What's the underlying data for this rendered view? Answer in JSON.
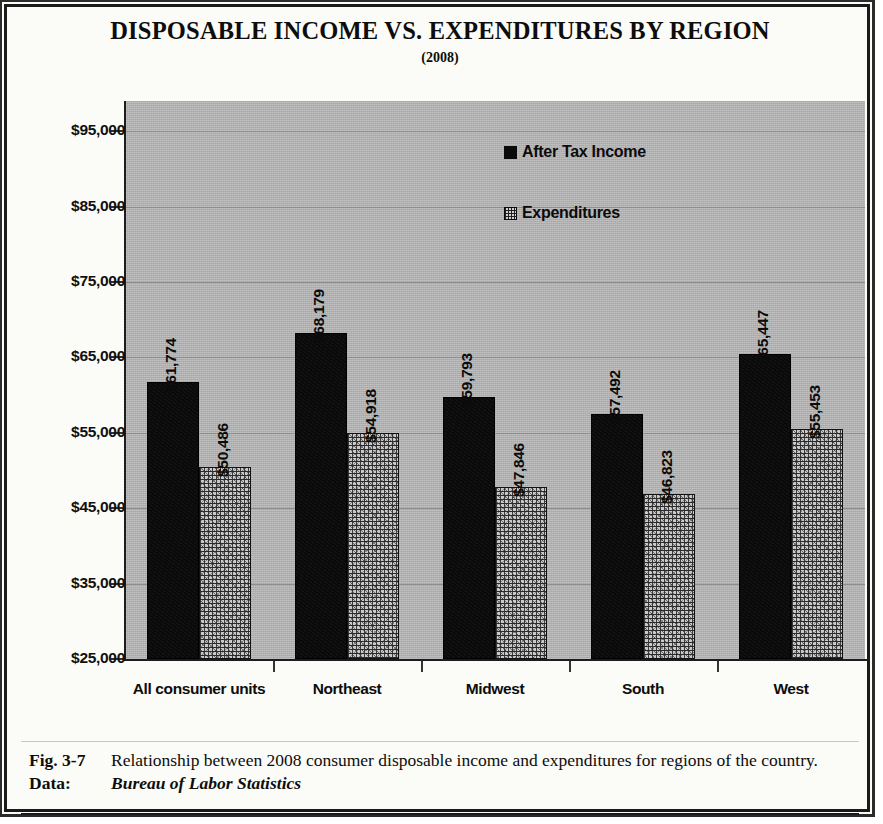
{
  "figure": {
    "title": "DISPOSABLE INCOME VS. EXPENDITURES BY REGION",
    "subtitle": "(2008)",
    "caption_number": "Fig. 3-7",
    "caption_text": "Relationship between 2008 consumer disposable income and expenditures for regions of the country.",
    "data_label": "Data:",
    "data_source": "Bureau of Labor Statistics"
  },
  "legend": {
    "position": "inside-top-center",
    "entries": [
      {
        "label": "After Tax Income",
        "swatch": "solid-black-square"
      },
      {
        "label": "Expenditures",
        "swatch": "crosshatch-square"
      }
    ]
  },
  "colors": {
    "plot_background": "#b0b0b0",
    "income_bar": "#0a0a0a",
    "expenditure_bar": "#c9c9c9",
    "gridline": "#8e8e8e",
    "axis": "#1c1c1c",
    "frame": "#1a1a1a",
    "page_background": "#fbfbf7"
  },
  "chart_data": {
    "type": "bar",
    "title": "DISPOSABLE INCOME VS. EXPENDITURES BY REGION",
    "subtitle": "(2008)",
    "xlabel": "",
    "ylabel": "",
    "ylim": [
      25000,
      99000
    ],
    "ytick_values": [
      25000,
      35000,
      45000,
      55000,
      65000,
      75000,
      85000,
      95000
    ],
    "ytick_labels": [
      "$25,000",
      "$35,000",
      "$45,000",
      "$55,000",
      "$65,000",
      "$75,000",
      "$85,000",
      "$95,000"
    ],
    "grid": true,
    "legend_position": "inside",
    "categories": [
      "All consumer units",
      "Northeast",
      "Midwest",
      "South",
      "West"
    ],
    "series": [
      {
        "name": "After Tax Income",
        "values": [
          61774,
          68179,
          59793,
          57492,
          65447
        ],
        "labels": [
          "$61,774",
          "$68,179",
          "$59,793",
          "$57,492",
          "$65,447"
        ]
      },
      {
        "name": "Expenditures",
        "values": [
          50486,
          54918,
          47846,
          46823,
          55453
        ],
        "labels": [
          "$50,486",
          "$54,918",
          "$47,846",
          "$46,823",
          "$55,453"
        ]
      }
    ]
  }
}
